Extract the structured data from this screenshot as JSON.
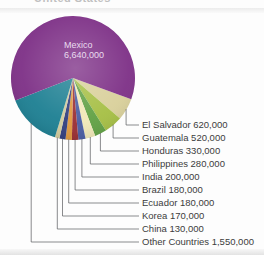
{
  "title_fragment": "United States",
  "chart_data": {
    "type": "pie",
    "title": "",
    "total": 10800000,
    "legend_position": "right-callouts",
    "slices": [
      {
        "label": "Mexico",
        "value": 6640000,
        "display": "Mexico 6,640,000",
        "color": "#7e3187",
        "label_inside": true,
        "inside_label_line1": "Mexico",
        "inside_label_line2": "6,640,000"
      },
      {
        "label": "El Salvador",
        "value": 620000,
        "display": "El Salvador 620,000",
        "color": "#d9d09b"
      },
      {
        "label": "Guatemala",
        "value": 520000,
        "display": "Guatemala 520,000",
        "color": "#a6bf45"
      },
      {
        "label": "Honduras",
        "value": 330000,
        "display": "Honduras 330,000",
        "color": "#61a144"
      },
      {
        "label": "Philippines",
        "value": 280000,
        "display": "Philippines 280,000",
        "color": "#f1e8b8"
      },
      {
        "label": "India",
        "value": 200000,
        "display": "India 200,000",
        "color": "#4a5da3"
      },
      {
        "label": "Brazil",
        "value": 180000,
        "display": "Brazil 180,000",
        "color": "#9a2e33"
      },
      {
        "label": "Ecuador",
        "value": 180000,
        "display": "Ecuador 180,000",
        "color": "#e0993f"
      },
      {
        "label": "Korea",
        "value": 170000,
        "display": "Korea 170,000",
        "color": "#333f7f"
      },
      {
        "label": "China",
        "value": 130000,
        "display": "China 130,000",
        "color": "#d3cc9e"
      },
      {
        "label": "Other Countries",
        "value": 1550000,
        "display": "Other Countries 1,550,000",
        "color": "#1e8093"
      }
    ]
  },
  "figure_colors": {
    "background": "#fdfdfd",
    "callout_line": "#58595b",
    "label_text": "#3c3c3c",
    "inner_label_text": "#e9dcef",
    "top_band": "#ececec",
    "bottom_band": "#e3e3e3"
  }
}
